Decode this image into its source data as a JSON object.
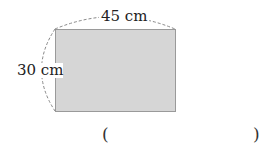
{
  "figure": {
    "shape": "rectangle",
    "fill_color": "#d6d6d6",
    "stroke_color": "#9a9a9a",
    "dimension_color": "#888888",
    "width_label": "45 cm",
    "height_label": "30 cm"
  },
  "answer": {
    "open_paren": "(",
    "close_paren": ")",
    "value": ""
  }
}
